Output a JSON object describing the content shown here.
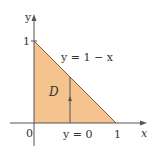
{
  "diagram": {
    "region_label": "D",
    "region_fill": "#f5c48e",
    "axis_color": "#555555",
    "boundary_color": "#8a5a2b",
    "axes": {
      "x_label": "x",
      "y_label": "y",
      "origin_label": "0",
      "x_tick_label": "1",
      "y_tick_label": "1"
    },
    "curves": {
      "upper": "y = 1 − x",
      "lower": "y = 0"
    }
  }
}
